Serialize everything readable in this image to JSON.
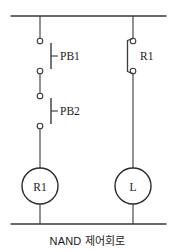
{
  "diagram": {
    "caption": "NAND 제어회로",
    "stroke_color": "#3a3a3a",
    "text_color": "#1a1a1a",
    "background_color": "#ffffff",
    "rails": {
      "top_label": "",
      "bottom_label": ""
    },
    "branches": [
      {
        "name": "left-branch",
        "contacts": [
          {
            "id": "pb1",
            "label": "PB1",
            "type": "normally-open-pushbutton"
          },
          {
            "id": "pb2",
            "label": "PB2",
            "type": "normally-open-pushbutton"
          }
        ],
        "coil": {
          "id": "coil-r1",
          "label": "R1",
          "type": "relay-coil"
        }
      },
      {
        "name": "right-branch",
        "contacts": [
          {
            "id": "r1-contact",
            "label": "R1",
            "type": "normally-closed-contact"
          }
        ],
        "coil": {
          "id": "coil-l",
          "label": "L",
          "type": "lamp"
        }
      }
    ]
  }
}
